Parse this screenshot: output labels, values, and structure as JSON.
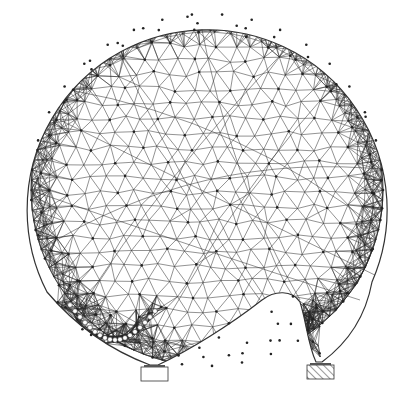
{
  "diagram": {
    "type": "structural-truss-drawing",
    "colors": {
      "background": "#ffffff",
      "stroke": "#2a2a2a",
      "node_fill": "#ffffff"
    },
    "outline": {
      "center": [
        207,
        190
      ],
      "radius": 180
    },
    "supports": [
      {
        "name": "left-support",
        "x": 141,
        "y": 367,
        "width": 27,
        "height": 14,
        "hatched": false
      },
      {
        "name": "right-support",
        "x": 307,
        "y": 365,
        "width": 27,
        "height": 14,
        "hatched": true
      }
    ]
  }
}
